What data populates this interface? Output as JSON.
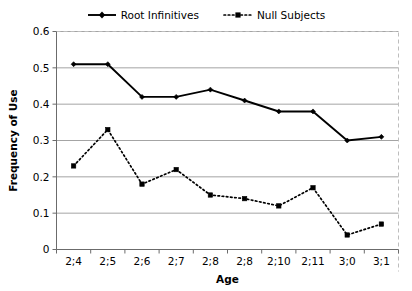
{
  "chart_data": {
    "type": "line",
    "title": "",
    "xlabel": "Age",
    "ylabel": "Frequency of Use",
    "categories": [
      "2;4",
      "2;5",
      "2;6",
      "2;7",
      "2;8",
      "2;8",
      "2;10",
      "2;11",
      "3;0",
      "3;1"
    ],
    "ylim": [
      0,
      0.6
    ],
    "yticks": [
      "0",
      "0.1",
      "0.2",
      "0.3",
      "0.4",
      "0.5",
      "0.6"
    ],
    "ytick_values": [
      0,
      0.1,
      0.2,
      0.3,
      0.4,
      0.5,
      0.6
    ],
    "grid": "horizontal",
    "legend_position": "top-center",
    "series": [
      {
        "name": "Root Infinitives",
        "marker": "diamond",
        "line_style": "solid",
        "color": "#000000",
        "values": [
          0.51,
          0.51,
          0.42,
          0.42,
          0.44,
          0.41,
          0.38,
          0.38,
          0.3,
          0.31
        ]
      },
      {
        "name": "Null Subjects",
        "marker": "square",
        "line_style": "dotted",
        "color": "#000000",
        "values": [
          0.23,
          0.33,
          0.18,
          0.22,
          0.15,
          0.14,
          0.12,
          0.17,
          0.04,
          0.07
        ]
      }
    ]
  },
  "legend": {
    "entries": [
      {
        "label": "Root Infinitives"
      },
      {
        "label": "Null Subjects"
      }
    ]
  },
  "axes": {
    "y_title": "Frequency of Use",
    "x_title": "Age"
  }
}
